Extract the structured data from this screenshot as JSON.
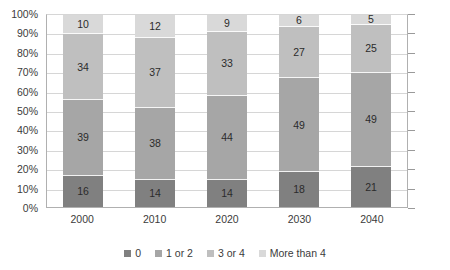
{
  "chart_data": {
    "type": "bar",
    "subtype": "100% stacked column",
    "title": "",
    "subtitle": "",
    "xlabel": "",
    "ylabel": "",
    "categories": [
      "2000",
      "2010",
      "2020",
      "2030",
      "2040"
    ],
    "series": [
      {
        "name": "0",
        "color": "#808080",
        "values": [
          16,
          14,
          14,
          18,
          21
        ]
      },
      {
        "name": "1 or 2",
        "color": "#a6a6a6",
        "values": [
          39,
          38,
          44,
          49,
          49
        ]
      },
      {
        "name": "3 or 4",
        "color": "#bfbfbf",
        "values": [
          34,
          37,
          33,
          27,
          25
        ]
      },
      {
        "name": "More than 4",
        "color": "#d9d9d9",
        "values": [
          10,
          12,
          9,
          6,
          5
        ]
      }
    ],
    "ylim": [
      0,
      100
    ],
    "y_tick_labels": [
      "100%",
      "90%",
      "80%",
      "70%",
      "60%",
      "50%",
      "40%",
      "30%",
      "20%",
      "10%",
      "0%"
    ],
    "y_tick_values": [
      100,
      90,
      80,
      70,
      60,
      50,
      40,
      30,
      20,
      10,
      0
    ],
    "grid": true,
    "legend_position": "bottom",
    "data_labels": true
  },
  "legend": {
    "items": [
      {
        "label": "0",
        "color": "#808080"
      },
      {
        "label": "1 or 2",
        "color": "#a6a6a6"
      },
      {
        "label": "3 or 4",
        "color": "#bfbfbf"
      },
      {
        "label": "More than 4",
        "color": "#d9d9d9"
      }
    ]
  }
}
